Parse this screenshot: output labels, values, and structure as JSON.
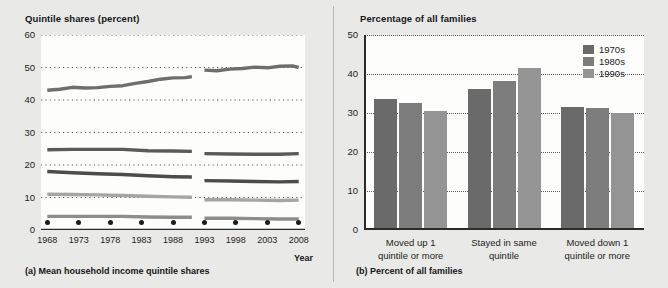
{
  "figure": {
    "background": "#e9e9e7",
    "plot_background": "#fdfdfc"
  },
  "panel_a": {
    "title": "Quintile shares (percent)",
    "caption": "(a) Mean household income quintile shares",
    "x_axis_label": "Year"
  },
  "panel_b": {
    "title": "Percentage of all families",
    "caption": "(b) Percent of all families"
  },
  "chart_data": [
    {
      "type": "line",
      "title": "Quintile shares (percent)",
      "subtitle": "(a) Mean household income quintile shares",
      "xlabel": "Year",
      "ylabel": "Quintile shares (percent)",
      "xlim": [
        1967,
        2009
      ],
      "ylim": [
        0,
        60
      ],
      "yticks": [
        0,
        10,
        20,
        30,
        40,
        50,
        60
      ],
      "xticks": [
        1968,
        1973,
        1978,
        1983,
        1988,
        1993,
        1998,
        2003,
        2008
      ],
      "grid": "horizontal-dotted",
      "legend": "none",
      "break_at_year": 1992,
      "note": "Series are discontinuous at 1992 due to a survey redesign",
      "series": [
        {
          "name": "Highest quintile",
          "color": "#6e6e6e",
          "x": [
            1968,
            1970,
            1972,
            1974,
            1976,
            1978,
            1980,
            1982,
            1984,
            1986,
            1988,
            1990,
            1991,
            1993,
            1995,
            1997,
            1999,
            2001,
            2003,
            2005,
            2007,
            2008
          ],
          "values": [
            43.0,
            43.3,
            43.9,
            43.7,
            43.8,
            44.2,
            44.4,
            45.1,
            45.7,
            46.4,
            46.8,
            46.9,
            47.2,
            49.2,
            49.0,
            49.5,
            49.7,
            50.1,
            49.9,
            50.4,
            50.5,
            50.0
          ]
        },
        {
          "name": "Fourth quintile",
          "color": "#5a5a5a",
          "x": [
            1968,
            1972,
            1976,
            1980,
            1984,
            1988,
            1991,
            1993,
            1997,
            2001,
            2005,
            2008
          ],
          "values": [
            24.7,
            24.8,
            24.8,
            24.8,
            24.4,
            24.3,
            24.2,
            23.5,
            23.4,
            23.3,
            23.3,
            23.5
          ]
        },
        {
          "name": "Third quintile",
          "color": "#4c4c4c",
          "x": [
            1968,
            1972,
            1976,
            1980,
            1984,
            1988,
            1991,
            1993,
            1997,
            2001,
            2005,
            2008
          ],
          "values": [
            18.0,
            17.6,
            17.3,
            17.1,
            16.7,
            16.4,
            16.3,
            15.2,
            15.1,
            14.9,
            14.8,
            14.9
          ]
        },
        {
          "name": "Second quintile",
          "color": "#a5a5a5",
          "x": [
            1968,
            1972,
            1976,
            1980,
            1984,
            1988,
            1991,
            1993,
            1997,
            2001,
            2005,
            2008
          ],
          "values": [
            11.0,
            10.9,
            10.8,
            10.6,
            10.4,
            10.2,
            10.1,
            9.3,
            9.3,
            9.2,
            9.1,
            9.2
          ]
        },
        {
          "name": "Lowest quintile",
          "color": "#8d8d8d",
          "x": [
            1968,
            1972,
            1976,
            1980,
            1984,
            1988,
            1991,
            1993,
            1997,
            2001,
            2005,
            2008
          ],
          "values": [
            4.2,
            4.2,
            4.2,
            4.2,
            4.0,
            3.9,
            3.9,
            3.6,
            3.6,
            3.5,
            3.4,
            3.4
          ]
        }
      ]
    },
    {
      "type": "bar",
      "title": "Percentage of all families",
      "subtitle": "(b) Percent of all families",
      "xlabel": "",
      "ylabel": "Percentage of all families",
      "ylim": [
        0,
        50
      ],
      "yticks": [
        0,
        10,
        20,
        30,
        40,
        50
      ],
      "grid": "horizontal-dotted",
      "legend_position": "top-right",
      "categories": [
        "Moved up 1 quintile or more",
        "Stayed in same quintile",
        "Moved down 1 quintile or more"
      ],
      "category_lines": [
        [
          "Moved up 1",
          "quintile or more"
        ],
        [
          "Stayed in same",
          "quintile"
        ],
        [
          "Moved down 1",
          "quintile or more"
        ]
      ],
      "series": [
        {
          "name": "1970s",
          "color": "#6a6a6a",
          "values": [
            33.5,
            36.2,
            31.5
          ]
        },
        {
          "name": "1980s",
          "color": "#7d7d7d",
          "values": [
            32.6,
            38.2,
            31.4
          ]
        },
        {
          "name": "1990s",
          "color": "#949494",
          "values": [
            30.5,
            41.5,
            30.0
          ]
        }
      ]
    }
  ]
}
